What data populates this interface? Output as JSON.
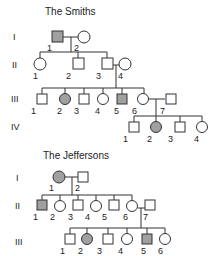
{
  "colors": {
    "affected": "#a0a0a0",
    "line": "#333333"
  },
  "families": [
    {
      "title": "The Smiths",
      "generations": [
        "I",
        "II",
        "III",
        "IV"
      ]
    },
    {
      "title": "The Jeffersons",
      "generations": [
        "I",
        "II",
        "III"
      ]
    }
  ],
  "smiths": {
    "gen1": [
      {
        "n": "1",
        "sex": "male",
        "affected": true
      },
      {
        "n": "2",
        "sex": "female",
        "affected": false
      }
    ],
    "gen2": [
      {
        "n": "1",
        "sex": "female",
        "affected": false
      },
      {
        "n": "2",
        "sex": "male",
        "affected": false
      },
      {
        "n": "3",
        "sex": "male",
        "affected": false
      },
      {
        "n": "4",
        "sex": "female",
        "affected": false
      }
    ],
    "gen3": [
      {
        "n": "1",
        "sex": "male",
        "affected": false
      },
      {
        "n": "2",
        "sex": "female",
        "affected": true
      },
      {
        "n": "3",
        "sex": "male",
        "affected": false
      },
      {
        "n": "4",
        "sex": "female",
        "affected": false
      },
      {
        "n": "5",
        "sex": "male",
        "affected": true
      },
      {
        "n": "6",
        "sex": "female",
        "affected": false
      },
      {
        "n": "7",
        "sex": "male",
        "affected": false
      }
    ],
    "gen4": [
      {
        "n": "1",
        "sex": "male",
        "affected": false
      },
      {
        "n": "2",
        "sex": "female",
        "affected": true
      },
      {
        "n": "3",
        "sex": "male",
        "affected": false
      },
      {
        "n": "4",
        "sex": "female",
        "affected": false
      }
    ]
  },
  "jeffersons": {
    "gen1": [
      {
        "n": "1",
        "sex": "female",
        "affected": true
      },
      {
        "n": "2",
        "sex": "male",
        "affected": false
      }
    ],
    "gen2": [
      {
        "n": "1",
        "sex": "male",
        "affected": true
      },
      {
        "n": "2",
        "sex": "female",
        "affected": false
      },
      {
        "n": "3",
        "sex": "male",
        "affected": false
      },
      {
        "n": "4",
        "sex": "female",
        "affected": false
      },
      {
        "n": "5",
        "sex": "male",
        "affected": false
      },
      {
        "n": "6",
        "sex": "female",
        "affected": false
      },
      {
        "n": "7",
        "sex": "male",
        "affected": false
      }
    ],
    "gen3": [
      {
        "n": "1",
        "sex": "male",
        "affected": false
      },
      {
        "n": "2",
        "sex": "female",
        "affected": true
      },
      {
        "n": "3",
        "sex": "male",
        "affected": false
      },
      {
        "n": "4",
        "sex": "female",
        "affected": false
      },
      {
        "n": "5",
        "sex": "male",
        "affected": true
      },
      {
        "n": "6",
        "sex": "female",
        "affected": false
      }
    ]
  }
}
